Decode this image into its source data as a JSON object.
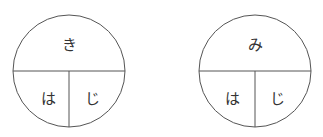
{
  "diagrams": [
    {
      "top": "き",
      "bottom_left": "は",
      "bottom_right": "じ",
      "cx": 69,
      "cy": 71,
      "r": 56
    },
    {
      "top": "み",
      "bottom_left": "は",
      "bottom_right": "じ",
      "cx": 255,
      "cy": 71,
      "r": 56
    }
  ],
  "colors": {
    "stroke": "#555555",
    "text": "#333333"
  }
}
